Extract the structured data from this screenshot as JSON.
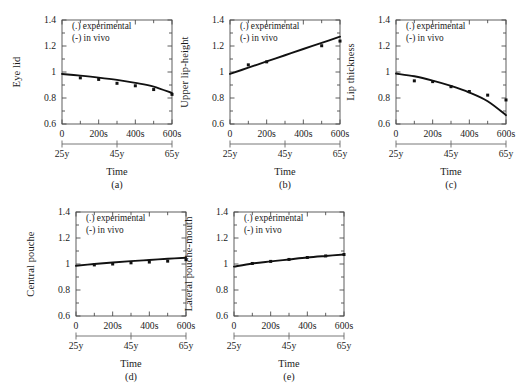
{
  "figure": {
    "background": "#ffffff",
    "ink": "#111111",
    "frame_color": "#4d4d4d"
  },
  "common": {
    "legend": {
      "experimental": "(.) experimental",
      "in_vivo": "(-) in vivo"
    },
    "xlabel": "Time",
    "x_ticks": [
      "0",
      "200s",
      "400s",
      "600s"
    ],
    "x_tick_values": [
      0,
      200,
      400,
      600
    ],
    "y_ticks": [
      "0.6",
      "0.8",
      "1",
      "1.2",
      "1.4"
    ],
    "y_tick_values": [
      0.6,
      0.8,
      1.0,
      1.2,
      1.4
    ],
    "age_ticks": [
      "25y",
      "45y",
      "65y"
    ],
    "age_tick_values": [
      0,
      300,
      600
    ],
    "xlim": [
      0,
      600
    ],
    "ylim": [
      0.6,
      1.4
    ],
    "grid": false,
    "legend_position": "top-center-inside"
  },
  "chart_data": [
    {
      "id": "a",
      "type": "scatter",
      "tag": "(a)",
      "title": "",
      "ylabel": "Eye lid",
      "xlabel": "Time",
      "xlim": [
        0,
        600
      ],
      "ylim": [
        0.6,
        1.4
      ],
      "grid": false,
      "legend": [
        "(.) experimental",
        "(-) in vivo"
      ],
      "series": [
        {
          "name": "in vivo",
          "render": "line",
          "x": [
            0,
            100,
            200,
            300,
            400,
            500,
            600
          ],
          "values": [
            0.985,
            0.972,
            0.957,
            0.939,
            0.916,
            0.888,
            0.838
          ]
        },
        {
          "name": "experimental",
          "render": "points",
          "x": [
            100,
            200,
            300,
            400,
            500,
            600
          ],
          "values": [
            0.955,
            0.943,
            0.913,
            0.894,
            0.865,
            0.828
          ]
        }
      ]
    },
    {
      "id": "b",
      "type": "scatter",
      "tag": "(b)",
      "title": "",
      "ylabel": "Upper lip-height",
      "xlabel": "Time",
      "xlim": [
        0,
        600
      ],
      "ylim": [
        0.6,
        1.4
      ],
      "grid": false,
      "legend": [
        "(.) experimental",
        "(-) in vivo"
      ],
      "series": [
        {
          "name": "in vivo",
          "render": "line",
          "x": [
            0,
            100,
            200,
            300,
            400,
            500,
            600
          ],
          "values": [
            0.985,
            1.033,
            1.081,
            1.129,
            1.177,
            1.224,
            1.272
          ]
        },
        {
          "name": "experimental",
          "render": "points",
          "x": [
            100,
            200,
            500,
            600
          ],
          "values": [
            1.055,
            1.078,
            1.202,
            1.238
          ]
        }
      ]
    },
    {
      "id": "c",
      "type": "scatter",
      "tag": "(c)",
      "title": "",
      "ylabel": "Lip thickness",
      "xlabel": "Time",
      "xlim": [
        0,
        600
      ],
      "ylim": [
        0.6,
        1.4
      ],
      "grid": false,
      "legend": [
        "(.) experimental",
        "(-) in vivo"
      ],
      "series": [
        {
          "name": "in vivo",
          "render": "line",
          "x": [
            0,
            100,
            200,
            300,
            400,
            500,
            600
          ],
          "values": [
            0.988,
            0.967,
            0.934,
            0.893,
            0.842,
            0.775,
            0.668
          ]
        },
        {
          "name": "experimental",
          "render": "points",
          "x": [
            100,
            200,
            300,
            400,
            500,
            600
          ],
          "values": [
            0.932,
            0.926,
            0.887,
            0.85,
            0.822,
            0.785
          ]
        }
      ]
    },
    {
      "id": "d",
      "type": "scatter",
      "tag": "(d)",
      "title": "",
      "ylabel": "Central pouche",
      "xlabel": "Time",
      "xlim": [
        0,
        600
      ],
      "ylim": [
        0.6,
        1.4
      ],
      "grid": false,
      "legend": [
        "(.) experimental",
        "(-) in vivo"
      ],
      "series": [
        {
          "name": "in vivo",
          "render": "line",
          "x": [
            0,
            100,
            200,
            300,
            400,
            500,
            600
          ],
          "values": [
            0.986,
            1.0,
            1.012,
            1.022,
            1.031,
            1.04,
            1.048
          ]
        },
        {
          "name": "experimental",
          "render": "points",
          "x": [
            100,
            200,
            300,
            400,
            500,
            600
          ],
          "values": [
            0.993,
            1.0,
            1.009,
            1.015,
            1.022,
            1.033
          ]
        }
      ]
    },
    {
      "id": "e",
      "type": "scatter",
      "tag": "(e)",
      "title": "",
      "ylabel": "Lateral pouche-mouth",
      "xlabel": "Time",
      "xlim": [
        0,
        600
      ],
      "ylim": [
        0.6,
        1.4
      ],
      "grid": false,
      "legend": [
        "(.) experimental",
        "(-) in vivo"
      ],
      "series": [
        {
          "name": "in vivo",
          "render": "line",
          "x": [
            0,
            100,
            200,
            300,
            400,
            500,
            600
          ],
          "values": [
            0.98,
            1.004,
            1.02,
            1.035,
            1.05,
            1.062,
            1.073
          ]
        },
        {
          "name": "experimental",
          "render": "points",
          "x": [
            100,
            200,
            300,
            400,
            500,
            600
          ],
          "values": [
            1.004,
            1.02,
            1.035,
            1.05,
            1.062,
            1.073
          ]
        }
      ]
    }
  ]
}
